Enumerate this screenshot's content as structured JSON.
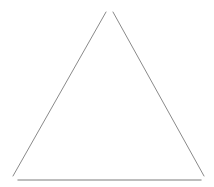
{
  "diagram": {
    "shape": "triangle",
    "style": "outline",
    "stroke_color": "#8a8a8a",
    "base_color": "#a8a8a8",
    "background": "#ffffff",
    "segments": {
      "left_side": {
        "x1": 106,
        "y1": 12,
        "x2": 13,
        "y2": 176
      },
      "right_side": {
        "x1": 113,
        "y1": 12,
        "x2": 204,
        "y2": 176
      },
      "base": {
        "x1": 18,
        "y1": 180,
        "x2": 201,
        "y2": 180
      }
    }
  }
}
